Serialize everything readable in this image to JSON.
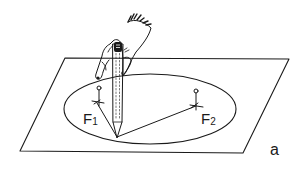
{
  "figure": {
    "panel_label": "a",
    "foci": [
      {
        "label_main": "F",
        "label_sub": "1"
      },
      {
        "label_main": "F",
        "label_sub": "2"
      }
    ],
    "elements": [
      "paper-sheet",
      "ellipse",
      "pin-f1",
      "pin-f2",
      "string",
      "pencil",
      "hand"
    ],
    "colors": {
      "ink": "#1a1a1a",
      "background": "#ffffff"
    }
  }
}
